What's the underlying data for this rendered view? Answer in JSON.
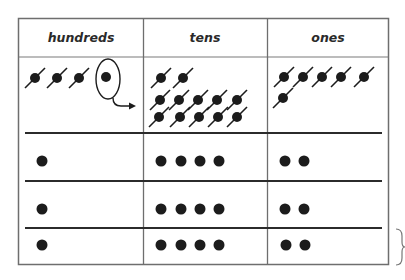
{
  "table": {
    "headers": [
      "hundreds",
      "tens",
      "ones"
    ],
    "colors": {
      "border": "#6e6e6e",
      "row_rule": "#2b2b2b",
      "dot": "#1c1c1c",
      "text": "#2a2a2a",
      "background": "#ffffff"
    },
    "regroup_row": {
      "hundreds": {
        "crossed_dots": 3,
        "circled_dots": 1,
        "arrow": "regroup-arrow-to-tens"
      },
      "tens": {
        "crossed_dots": 12
      },
      "ones": {
        "crossed_dots": 6
      }
    },
    "result_rows": [
      {
        "hundreds": 1,
        "tens": 4,
        "ones": 2
      },
      {
        "hundreds": 1,
        "tens": 4,
        "ones": 2
      },
      {
        "hundreds": 1,
        "tens": 4,
        "ones": 2
      }
    ],
    "bracket": "right-brace-icon"
  }
}
